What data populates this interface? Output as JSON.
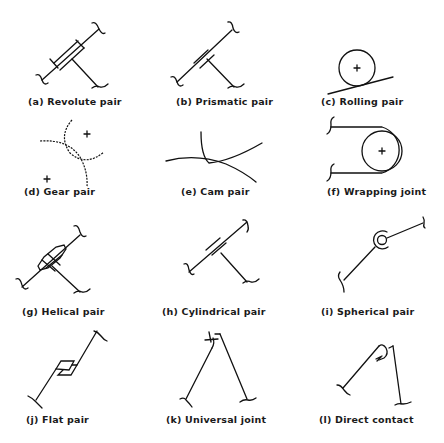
{
  "panels": [
    {
      "id": "a",
      "label": "(a) Revolute pair"
    },
    {
      "id": "b",
      "label": "(b) Prismatic pair"
    },
    {
      "id": "c",
      "label": "(c) Rolling pair"
    },
    {
      "id": "d",
      "label": "(d) Gear pair"
    },
    {
      "id": "e",
      "label": "(e) Cam pair"
    },
    {
      "id": "f",
      "label": "(f) Wrapping joint"
    },
    {
      "id": "g",
      "label": "(g) Helical pair"
    },
    {
      "id": "h",
      "label": "(h) Cylindrical pair"
    },
    {
      "id": "i",
      "label": "(i) Spherical pair"
    },
    {
      "id": "j",
      "label": "(j) Flat pair"
    },
    {
      "id": "k",
      "label": "(k) Universal joint"
    },
    {
      "id": "l",
      "label": "(l) Direct contact"
    }
  ],
  "center_mark": "+"
}
